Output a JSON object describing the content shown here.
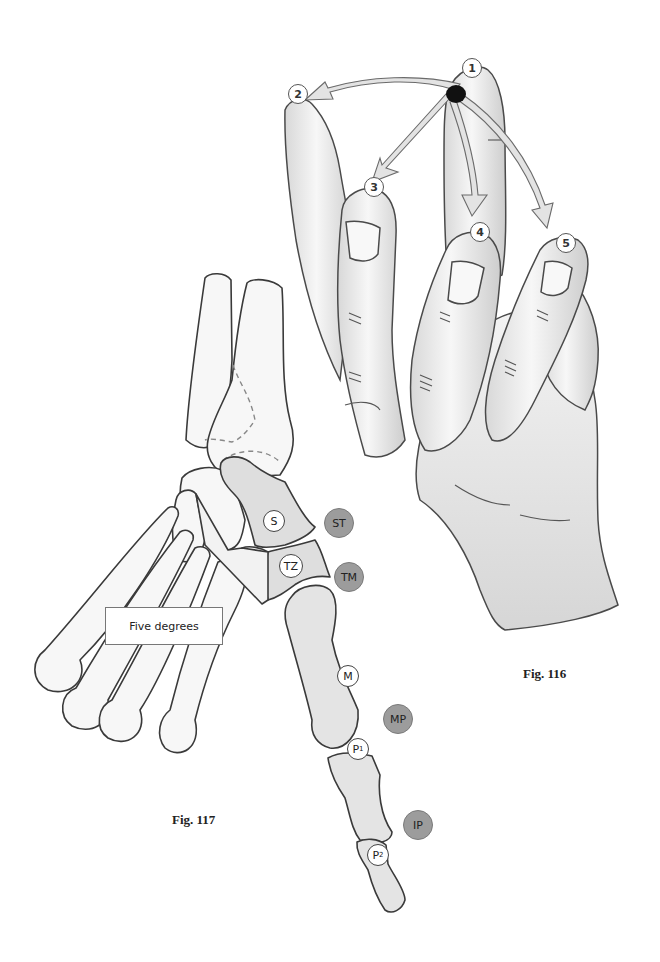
{
  "figures": {
    "fig116": {
      "caption": "Fig. 116",
      "description": "Hand showing thumb opposition movement from position 1 to positions 2-5",
      "positions": [
        {
          "label": "1"
        },
        {
          "label": "2"
        },
        {
          "label": "3"
        },
        {
          "label": "4"
        },
        {
          "label": "5"
        }
      ]
    },
    "fig117": {
      "caption": "Fig. 117",
      "description": "Skeletal wrist and thumb with labeled bones and joints",
      "callout": "Five degrees",
      "bones": [
        {
          "label": "S"
        },
        {
          "label": "TZ"
        },
        {
          "label": "M"
        },
        {
          "label": "P",
          "sub": "1"
        },
        {
          "label": "P",
          "sub": "2"
        }
      ],
      "joints": [
        {
          "label": "ST"
        },
        {
          "label": "TM"
        },
        {
          "label": "MP"
        },
        {
          "label": "IP"
        }
      ]
    }
  },
  "colors": {
    "outline": "#3a3a3a",
    "bone_fill": "#f4f4f4",
    "highlight_bone_fill": "#dedede",
    "joint_circle": "#9c9c9c",
    "arrow_fill": "#e2e2e2",
    "skin_light": "#f2f2f2",
    "skin_shade": "#cfcfcf"
  }
}
